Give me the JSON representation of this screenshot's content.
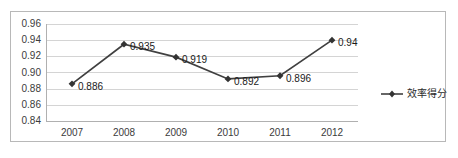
{
  "chart_data": {
    "type": "line",
    "title": "",
    "xlabel": "",
    "ylabel": "",
    "categories": [
      "2007",
      "2008",
      "2009",
      "2010",
      "2011",
      "2012"
    ],
    "series": [
      {
        "name": "效率得分",
        "values": [
          0.886,
          0.935,
          0.919,
          0.892,
          0.896,
          0.94
        ],
        "labels": [
          "0.886",
          "0.935",
          "0.919",
          "0.892",
          "0.896",
          "0.94"
        ],
        "color": "#404040",
        "marker": "diamond"
      }
    ],
    "ylim": [
      0.84,
      0.96
    ],
    "yticks": [
      0.96,
      0.94,
      0.92,
      0.9,
      0.88,
      0.86,
      0.84
    ],
    "ytick_labels": [
      "0.96",
      "0.94",
      "0.92",
      "0.90",
      "0.88",
      "0.86",
      "0.84"
    ],
    "grid": true,
    "grid_color": "#d4d4d4",
    "legend_position": "right",
    "border_color": "#b8b8b8",
    "background": "#ffffff"
  },
  "legend": {
    "entries": [
      {
        "label": "效率得分",
        "marker_name": "line-diamond-marker"
      }
    ]
  }
}
